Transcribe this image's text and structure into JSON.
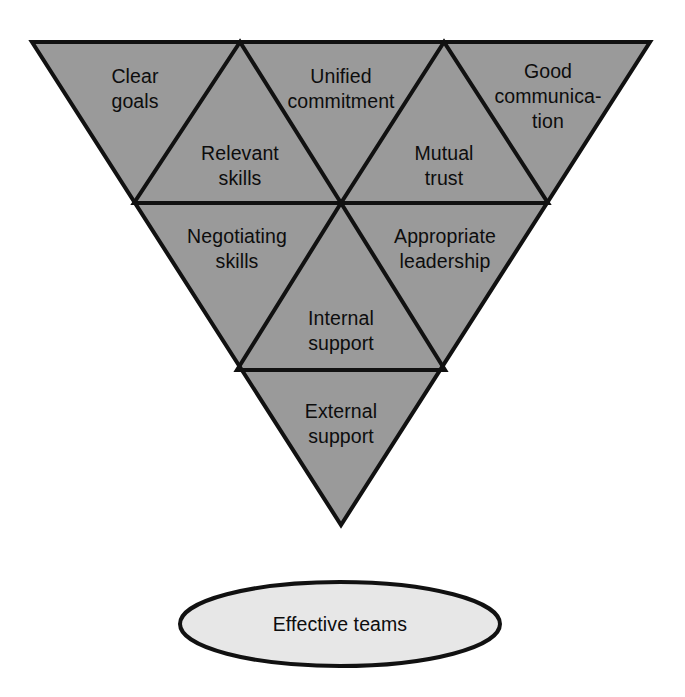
{
  "figure": {
    "type": "inverted-triangle-diagram",
    "background_color": "#ffffff",
    "triangle_fill": "#9a9a9a",
    "ellipse_fill": "#e7e7e7",
    "stroke_color": "#111111",
    "text_color": "#0d0d0d"
  },
  "triangle": {
    "name": "effective-teams-triangle",
    "cells": [
      {
        "id": "clear-goals",
        "orientation": "inverted",
        "row": 1,
        "position": "left",
        "lines": [
          "Clear",
          "goals"
        ]
      },
      {
        "id": "relevant-skills",
        "orientation": "upright",
        "row": 1,
        "position": "left-inner",
        "lines": [
          "Relevant",
          "skills"
        ]
      },
      {
        "id": "unified-commitment",
        "orientation": "inverted",
        "row": 1,
        "position": "center",
        "lines": [
          "Unified",
          "commitment"
        ]
      },
      {
        "id": "mutual-trust",
        "orientation": "upright",
        "row": 1,
        "position": "right-inner",
        "lines": [
          "Mutual",
          "trust"
        ]
      },
      {
        "id": "good-communication",
        "orientation": "inverted",
        "row": 1,
        "position": "right",
        "lines": [
          "Good",
          "communica-",
          "tion"
        ]
      },
      {
        "id": "negotiating-skills",
        "orientation": "inverted",
        "row": 2,
        "position": "left",
        "lines": [
          "Negotiating",
          "skills"
        ]
      },
      {
        "id": "internal-support",
        "orientation": "upright",
        "row": 2,
        "position": "center-inner",
        "lines": [
          "Internal",
          "support"
        ]
      },
      {
        "id": "appropriate-leadership",
        "orientation": "inverted",
        "row": 2,
        "position": "right",
        "lines": [
          "Appropriate",
          "leadership"
        ]
      },
      {
        "id": "external-support",
        "orientation": "inverted",
        "row": 3,
        "position": "center",
        "lines": [
          "External",
          "support"
        ]
      }
    ]
  },
  "outcome": {
    "id": "effective-teams",
    "shape": "ellipse",
    "label": "Effective teams"
  }
}
